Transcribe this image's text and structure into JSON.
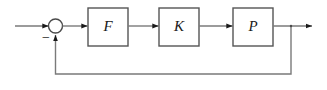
{
  "diagram": {
    "type": "control-block-diagram",
    "background_color": "#ffffff",
    "line_color": "#7a7a7a",
    "box_border_color": "#555555",
    "arrow_color": "#1a1a1a",
    "text_color": "#1a1a1a",
    "blocks": [
      {
        "id": "F",
        "label": "F",
        "x": 88,
        "y": 8,
        "w": 40,
        "h": 38
      },
      {
        "id": "K",
        "label": "K",
        "x": 159,
        "y": 8,
        "w": 40,
        "h": 38
      },
      {
        "id": "P",
        "label": "P",
        "x": 233,
        "y": 8,
        "w": 40,
        "h": 38
      }
    ],
    "summing_junction": {
      "id": "sum",
      "cx": 55.5,
      "cy": 26,
      "r": 7,
      "feedback_sign": "−",
      "sign_x": 46,
      "sign_y": 38
    },
    "signals": [
      {
        "id": "reference-input",
        "label": "",
        "from_x": 15,
        "from_y": 26,
        "to_x": 48,
        "to_y": 26
      },
      {
        "id": "error-to-F",
        "label": "",
        "from_x": 63,
        "from_y": 26,
        "to_x": 87,
        "to_y": 26
      },
      {
        "id": "F-to-K",
        "label": "",
        "from_x": 128,
        "from_y": 26,
        "to_x": 158,
        "to_y": 26
      },
      {
        "id": "K-to-P",
        "label": "",
        "from_x": 199,
        "from_y": 26,
        "to_x": 232,
        "to_y": 26
      },
      {
        "id": "plant-output",
        "label": "",
        "from_x": 273,
        "from_y": 26,
        "to_x": 312,
        "to_y": 26
      },
      {
        "id": "feedback-path",
        "label": "",
        "tap_x": 291,
        "bottom_y": 74,
        "return_x": 55.5,
        "enters_sum_at_y": 34
      }
    ]
  }
}
